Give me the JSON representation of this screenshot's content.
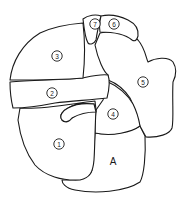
{
  "diagram": {
    "type": "segment-map",
    "stroke_color": "#1a1a1a",
    "fill_color": "#ffffff",
    "regions": [
      {
        "id": "1",
        "label": "1",
        "encircled": true
      },
      {
        "id": "2",
        "label": "2",
        "encircled": true
      },
      {
        "id": "3",
        "label": "3",
        "encircled": true
      },
      {
        "id": "4",
        "label": "4",
        "encircled": true
      },
      {
        "id": "5",
        "label": "5",
        "encircled": true
      },
      {
        "id": "6",
        "label": "6",
        "encircled": true
      },
      {
        "id": "7",
        "label": "7",
        "encircled": true
      },
      {
        "id": "A",
        "label": "A",
        "encircled": false
      }
    ]
  }
}
